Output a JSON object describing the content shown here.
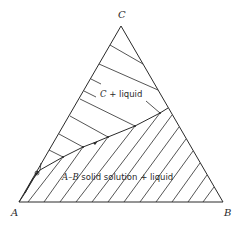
{
  "diagram": {
    "type": "ternary-phase-diagram",
    "vertices": {
      "A": {
        "label": "A"
      },
      "B": {
        "label": "B"
      },
      "C": {
        "label": "C"
      }
    },
    "regions": [
      {
        "id": "upper",
        "label_italic": "C",
        "label_rest": " + liquid"
      },
      {
        "id": "lower",
        "label_italic": "A–B",
        "label_rest": " solid solution + liquid"
      }
    ]
  }
}
